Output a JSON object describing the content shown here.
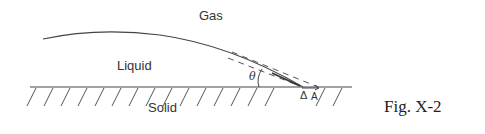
{
  "figure": {
    "caption": "Fig. X-2",
    "labels": {
      "gas": "Gas",
      "liquid": "Liquid",
      "solid": "Solid",
      "angle": "θ",
      "point_label": "A",
      "delta": "Δ"
    },
    "colors": {
      "line": "#444444",
      "text": "#333333",
      "background": "#ffffff"
    }
  }
}
